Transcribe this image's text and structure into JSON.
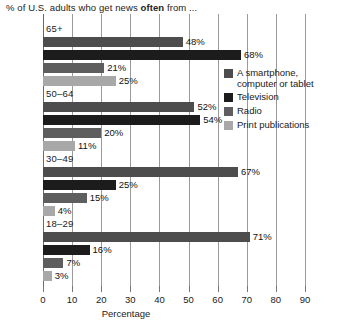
{
  "chart_data": {
    "type": "bar",
    "orientation": "horizontal",
    "title": "% of U.S. adults who get news often from ...",
    "title_prefix": "% of U.S. adults who get news ",
    "title_emphasis": "often",
    "title_suffix": " from ...",
    "xlabel": "Percentage",
    "ylabel": "",
    "xlim": [
      0,
      90
    ],
    "xticks": [
      0,
      10,
      20,
      30,
      40,
      50,
      60,
      70,
      80,
      90
    ],
    "xtick_labels": [
      "0",
      "10",
      "20",
      "30",
      "40",
      "50",
      "60",
      "70",
      "80",
      "90"
    ],
    "grid": true,
    "grid_axis": "x",
    "legend_position": "right",
    "categories": [
      "65+",
      "50–64",
      "30–49",
      "18–29"
    ],
    "series": [
      {
        "name": "A smartphone,\ncomputer or tablet",
        "legend_label_line1": "A smartphone,",
        "legend_label_line2": "computer or tablet",
        "color": "#4d4d4d",
        "values": [
          48,
          52,
          67,
          71
        ],
        "value_labels": [
          "48%",
          "52%",
          "67%",
          "71%"
        ]
      },
      {
        "name": "Television",
        "legend_label_line1": "Television",
        "legend_label_line2": "",
        "color": "#1c1c1c",
        "values": [
          68,
          54,
          25,
          16
        ],
        "value_labels": [
          "68%",
          "54%",
          "25%",
          "16%"
        ]
      },
      {
        "name": "Radio",
        "legend_label_line1": "Radio",
        "legend_label_line2": "",
        "color": "#5e5e5e",
        "values": [
          21,
          20,
          15,
          7
        ],
        "value_labels": [
          "21%",
          "20%",
          "15%",
          "7%"
        ]
      },
      {
        "name": "Print publications",
        "legend_label_line1": "Print publications",
        "legend_label_line2": "",
        "color": "#a8a8a8",
        "values": [
          25,
          11,
          4,
          3
        ],
        "value_labels": [
          "25%",
          "11%",
          "4%",
          "3%"
        ]
      }
    ],
    "groups": [
      {
        "label": "65+",
        "bars": [
          {
            "series": "A smartphone, computer or tablet",
            "value": 48,
            "label": "48%",
            "color": "#4d4d4d"
          },
          {
            "series": "Television",
            "value": 68,
            "label": "68%",
            "color": "#1c1c1c"
          },
          {
            "series": "Radio",
            "value": 21,
            "label": "21%",
            "color": "#5e5e5e"
          },
          {
            "series": "Print publications",
            "value": 25,
            "label": "25%",
            "color": "#a8a8a8"
          }
        ]
      },
      {
        "label": "50–64",
        "bars": [
          {
            "series": "A smartphone, computer or tablet",
            "value": 52,
            "label": "52%",
            "color": "#4d4d4d"
          },
          {
            "series": "Television",
            "value": 54,
            "label": "54%",
            "color": "#1c1c1c"
          },
          {
            "series": "Radio",
            "value": 20,
            "label": "20%",
            "color": "#5e5e5e"
          },
          {
            "series": "Print publications",
            "value": 11,
            "label": "11%",
            "color": "#a8a8a8"
          }
        ]
      },
      {
        "label": "30–49",
        "bars": [
          {
            "series": "A smartphone, computer or tablet",
            "value": 67,
            "label": "67%",
            "color": "#4d4d4d"
          },
          {
            "series": "Television",
            "value": 25,
            "label": "25%",
            "color": "#1c1c1c"
          },
          {
            "series": "Radio",
            "value": 15,
            "label": "15%",
            "color": "#5e5e5e"
          },
          {
            "series": "Print publications",
            "value": 4,
            "label": "4%",
            "color": "#a8a8a8"
          }
        ]
      },
      {
        "label": "18–29",
        "bars": [
          {
            "series": "A smartphone, computer or tablet",
            "value": 71,
            "label": "71%",
            "color": "#4d4d4d"
          },
          {
            "series": "Television",
            "value": 16,
            "label": "16%",
            "color": "#1c1c1c"
          },
          {
            "series": "Radio",
            "value": 7,
            "label": "7%",
            "color": "#5e5e5e"
          },
          {
            "series": "Print publications",
            "value": 3,
            "label": "3%",
            "color": "#a8a8a8"
          }
        ]
      }
    ]
  },
  "style": {
    "background": "#ffffff",
    "grid_color": "#9a9a9a",
    "axis_color": "#6a6a6a",
    "text_color": "#1a1a1a"
  }
}
